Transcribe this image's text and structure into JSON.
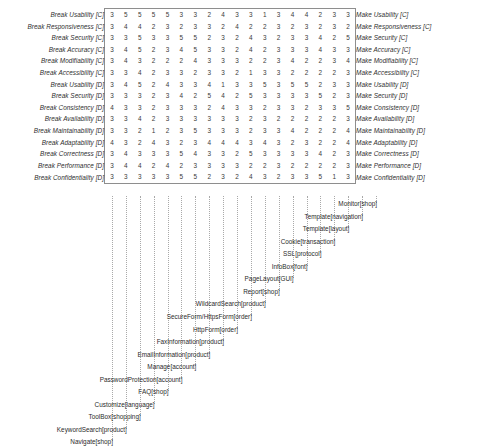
{
  "figure": {
    "type": "matrix-with-column-labels",
    "row_labels_left": [
      "Break Usability [C]",
      "Break Responsiveness [C]",
      "Break Security [C]",
      "Break Accuracy [C]",
      "Break Modifiability [C]",
      "Break Accessibility [C]",
      "Break Usability [D]",
      "Break Security [D]",
      "Break Consistency [D]",
      "Break Availability [D]",
      "Break Maintainability [D]",
      "Break Adaptability [D]",
      "Break Correctness [D]",
      "Break Performance [D]",
      "Break Confidentiality [D]"
    ],
    "row_labels_right": [
      "Make Usability [C]",
      "Make Responsiveness [C]",
      "Make Security [C]",
      "Make Accuracy [C]",
      "Make Modifiability [C]",
      "Make Accessibility [C]",
      "Make Usability [D]",
      "Make Security [D]",
      "Make Consistency [D]",
      "Make Availability [D]",
      "Make Maintainability [D]",
      "Make Adaptability [D]",
      "Make Correctness [D]",
      "Make Performance [D]",
      "Make Confidentiality [D]"
    ],
    "column_labels": [
      "Navigate[shop]",
      "KeywordSearch[product]",
      "ToolBox[shopping]",
      "Customize[language]",
      "FAQ[shop]",
      "PasswordProtection[account]",
      "Manage[account]",
      "EmailInformation[product]",
      "FaxInformation[product]",
      "HttpForm[order]",
      "SecureForm/HttpsForm[order]",
      "WildcardSearch[product]",
      "Report[shop]",
      "PageLayout[GUI]",
      "InfoBox[font]",
      "SSL[protocol]",
      "Cookie[transaction]",
      "Template[layout]",
      "Template[navigation]",
      "Monitor[shop]"
    ],
    "matrix": [
      [
        3,
        5,
        5,
        5,
        5,
        3,
        3,
        2,
        4,
        3,
        3,
        1,
        3,
        4,
        4,
        2,
        3,
        3
      ],
      [
        3,
        4,
        4,
        2,
        3,
        2,
        3,
        3,
        2,
        4,
        2,
        2,
        3,
        2,
        3,
        2,
        3,
        2
      ],
      [
        3,
        3,
        5,
        3,
        3,
        5,
        5,
        2,
        3,
        2,
        4,
        3,
        2,
        3,
        3,
        4,
        2,
        5
      ],
      [
        3,
        4,
        5,
        2,
        3,
        4,
        5,
        3,
        3,
        2,
        4,
        2,
        3,
        3,
        3,
        4,
        3,
        3
      ],
      [
        3,
        4,
        3,
        2,
        2,
        2,
        4,
        3,
        3,
        3,
        2,
        2,
        3,
        4,
        2,
        2,
        3,
        4
      ],
      [
        3,
        3,
        4,
        2,
        3,
        3,
        2,
        3,
        3,
        2,
        1,
        3,
        3,
        2,
        2,
        2,
        2,
        3
      ],
      [
        3,
        4,
        5,
        2,
        4,
        3,
        3,
        4,
        1,
        3,
        3,
        5,
        3,
        5,
        5,
        2,
        3,
        3
      ],
      [
        3,
        3,
        3,
        2,
        3,
        4,
        2,
        5,
        4,
        2,
        5,
        3,
        3,
        3,
        3,
        5,
        2,
        3
      ],
      [
        4,
        3,
        3,
        2,
        3,
        3,
        3,
        2,
        4,
        3,
        3,
        2,
        3,
        3,
        2,
        3,
        3,
        5
      ],
      [
        3,
        3,
        4,
        2,
        3,
        3,
        3,
        3,
        3,
        3,
        2,
        3,
        2,
        2,
        2,
        2,
        2,
        3
      ],
      [
        3,
        3,
        2,
        1,
        2,
        3,
        5,
        3,
        3,
        3,
        2,
        3,
        3,
        4,
        2,
        2,
        2,
        4
      ],
      [
        4,
        3,
        2,
        4,
        3,
        2,
        3,
        4,
        4,
        4,
        3,
        4,
        3,
        2,
        3,
        2,
        2,
        4
      ],
      [
        3,
        4,
        3,
        3,
        3,
        5,
        4,
        3,
        3,
        2,
        5,
        3,
        3,
        3,
        3,
        4,
        2,
        3
      ],
      [
        3,
        4,
        4,
        2,
        4,
        2,
        3,
        3,
        3,
        3,
        2,
        2,
        3,
        2,
        2,
        2,
        2,
        3
      ],
      [
        3,
        3,
        3,
        3,
        3,
        5,
        5,
        2,
        3,
        2,
        4,
        3,
        2,
        3,
        3,
        5,
        1,
        3
      ]
    ]
  }
}
